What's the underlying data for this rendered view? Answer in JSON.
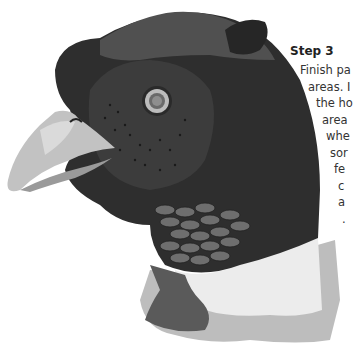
{
  "step": {
    "title": "Step 3",
    "lines": [
      {
        "text": "Finish pa",
        "indent": 0
      },
      {
        "text": "areas. I",
        "indent": 8
      },
      {
        "text": "the ho",
        "indent": 16
      },
      {
        "text": "area",
        "indent": 22
      },
      {
        "text": "whe",
        "indent": 26
      },
      {
        "text": "sor",
        "indent": 30
      },
      {
        "text": "fe",
        "indent": 34
      },
      {
        "text": "c",
        "indent": 38
      },
      {
        "text": "a",
        "indent": 38
      },
      {
        "text": ".",
        "indent": 42
      }
    ]
  },
  "illustration": {
    "subject": "pheasant-head-drawing",
    "colors": {
      "dark_plumage": "#2a2a2a",
      "mid_plumage": "#4a4a4a",
      "beak": "#b8b8b8",
      "beak_light": "#d4d4d4",
      "scales": "#6a6a6a",
      "white_collar": "#e8e8e8",
      "shadow": "#a0a0a0"
    }
  }
}
